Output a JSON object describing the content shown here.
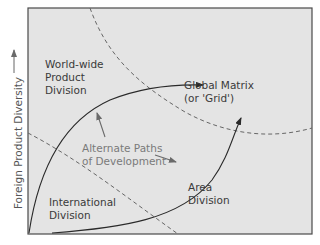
{
  "diagram": {
    "y_axis_label": "Foreign Product Diversity",
    "y_axis_arrow": "arrow-up",
    "regions": [
      {
        "id": "worldwide-product-division",
        "lines": [
          "World-wide",
          "Product",
          "Division"
        ]
      },
      {
        "id": "global-matrix",
        "lines": [
          "Global Matrix",
          "(or 'Grid')"
        ]
      },
      {
        "id": "international-division",
        "lines": [
          "International",
          "Division"
        ]
      },
      {
        "id": "area-division",
        "lines": [
          "Area",
          "Division"
        ]
      }
    ],
    "callout": {
      "lines": [
        "Alternate Paths",
        "of Development"
      ]
    },
    "colors": {
      "background": "#e4e4e4",
      "frame": "#4a4a4a",
      "solid_path": "#2a2a2a",
      "dashed_boundary": "#666666",
      "callout_text": "#7a7a7a"
    }
  }
}
